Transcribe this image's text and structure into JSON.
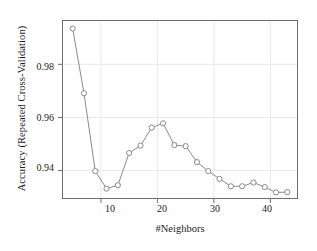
{
  "chart_data": {
    "type": "line",
    "title": "",
    "xlabel": "#Neighbors",
    "ylabel": "Accuracy (Repeated Cross-Validation)",
    "xlim": [
      3.2,
      44.8
    ],
    "ylim": [
      0.9295,
      0.9965
    ],
    "grid": true,
    "grid_axis": "both",
    "legend": null,
    "marker": "open-circle",
    "line_color": "#8a8a8a",
    "marker_edge_color": "#8a8a8a",
    "marker_face_color": "#ffffff",
    "xticks": [
      10,
      20,
      30,
      40
    ],
    "xtick_labels": [
      "10",
      "20",
      "30",
      "40"
    ],
    "yticks": [
      0.94,
      0.96,
      0.98
    ],
    "ytick_labels": [
      "0.94",
      "0.96",
      "0.98"
    ],
    "x": [
      5,
      7,
      9,
      11,
      13,
      15,
      17,
      19,
      21,
      23,
      25,
      27,
      29,
      31,
      33,
      35,
      37,
      39,
      41,
      43
    ],
    "values": [
      0.9935,
      0.9691,
      0.9398,
      0.9332,
      0.9345,
      0.9466,
      0.9494,
      0.9562,
      0.9578,
      0.9496,
      0.9492,
      0.9432,
      0.9398,
      0.9369,
      0.9341,
      0.9341,
      0.9355,
      0.9338,
      0.9318,
      0.9319
    ],
    "series": [
      {
        "name": "Accuracy (Repeated Cross-Validation)",
        "values": [
          0.9935,
          0.9691,
          0.9398,
          0.9332,
          0.9345,
          0.9466,
          0.9494,
          0.9562,
          0.9578,
          0.9496,
          0.9492,
          0.9432,
          0.9398,
          0.9369,
          0.9341,
          0.9341,
          0.9355,
          0.9338,
          0.9318,
          0.9319
        ]
      }
    ]
  },
  "figure": {
    "background_color": "#ffffff",
    "frame_color": "#6e6e6e",
    "grid_color": "#e8e8e8",
    "text_color": "#1c1c1c"
  }
}
